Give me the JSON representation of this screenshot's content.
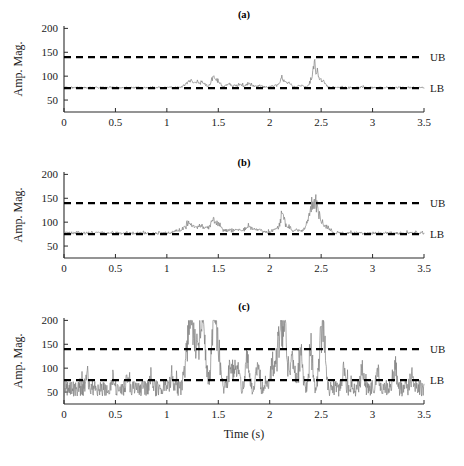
{
  "figure": {
    "width": 464,
    "height": 466,
    "background": "#ffffff",
    "signal_color": "#808080",
    "bound_color": "#000000",
    "axis_color": "#2b2b2b"
  },
  "axis_titles": {
    "x": "Time (s)",
    "y": "Amp. Mag."
  },
  "bounds": {
    "upper_label": "UB",
    "lower_label": "LB",
    "upper_value": 140,
    "lower_value": 75
  },
  "chart_data": [
    {
      "type": "line",
      "title": "(a)",
      "xlabel": "",
      "ylabel": "Amp. Mag.",
      "xlim": [
        0,
        3.5
      ],
      "ylim": [
        25,
        205
      ],
      "xticks": [
        0,
        0.5,
        1,
        1.5,
        2,
        2.5,
        3,
        3.5
      ],
      "xticklabels": [
        "0",
        "0.5",
        "1",
        "1.5",
        "2",
        "2.5",
        "3",
        "3.5"
      ],
      "yticks": [
        50,
        100,
        150,
        200
      ],
      "yticklabels": [
        "50",
        "100",
        "150",
        "200"
      ],
      "grid": false,
      "legend": "none",
      "annotations": [
        {
          "text": "UB",
          "y": 140,
          "position": "right-outside"
        },
        {
          "text": "LB",
          "y": 75,
          "position": "right-outside"
        }
      ],
      "hlines": [
        140,
        75
      ],
      "series": [
        {
          "name": "amplitude-magnitude",
          "color": "#808080",
          "baseline": 76,
          "noise": 2.0,
          "seed": 11,
          "n_points": 700,
          "bursts": [
            {
              "center": 1.22,
              "width": 0.035,
              "amp": 20
            },
            {
              "center": 1.29,
              "width": 0.03,
              "amp": 10
            },
            {
              "center": 1.35,
              "width": 0.03,
              "amp": 13
            },
            {
              "center": 1.45,
              "width": 0.022,
              "amp": 22
            },
            {
              "center": 1.49,
              "width": 0.025,
              "amp": 20
            },
            {
              "center": 1.6,
              "width": 0.03,
              "amp": 9
            },
            {
              "center": 1.7,
              "width": 0.035,
              "amp": 8
            },
            {
              "center": 1.8,
              "width": 0.03,
              "amp": 11
            },
            {
              "center": 1.9,
              "width": 0.03,
              "amp": 6
            },
            {
              "center": 2.05,
              "width": 0.03,
              "amp": 7
            },
            {
              "center": 2.12,
              "width": 0.022,
              "amp": 26
            },
            {
              "center": 2.18,
              "width": 0.03,
              "amp": 12
            },
            {
              "center": 2.3,
              "width": 0.03,
              "amp": 6
            },
            {
              "center": 2.44,
              "width": 0.03,
              "amp": 63
            },
            {
              "center": 2.52,
              "width": 0.025,
              "amp": 18
            }
          ]
        }
      ]
    },
    {
      "type": "line",
      "title": "(b)",
      "xlabel": "",
      "ylabel": "Amp. Mag.",
      "xlim": [
        0,
        3.5
      ],
      "ylim": [
        25,
        205
      ],
      "xticks": [
        0,
        0.5,
        1,
        1.5,
        2,
        2.5,
        3,
        3.5
      ],
      "xticklabels": [
        "0",
        "0.5",
        "1",
        "1.5",
        "2",
        "2.5",
        "3",
        "3.5"
      ],
      "yticks": [
        50,
        100,
        150,
        200
      ],
      "yticklabels": [
        "50",
        "100",
        "150",
        "200"
      ],
      "grid": false,
      "legend": "none",
      "annotations": [
        {
          "text": "UB",
          "y": 140,
          "position": "right-outside"
        },
        {
          "text": "LB",
          "y": 75,
          "position": "right-outside"
        }
      ],
      "hlines": [
        140,
        75
      ],
      "series": [
        {
          "name": "amplitude-magnitude",
          "color": "#808080",
          "baseline": 77,
          "noise": 3.0,
          "seed": 29,
          "n_points": 700,
          "bursts": [
            {
              "center": 1.1,
              "width": 0.03,
              "amp": 6
            },
            {
              "center": 1.2,
              "width": 0.035,
              "amp": 24
            },
            {
              "center": 1.26,
              "width": 0.03,
              "amp": 14
            },
            {
              "center": 1.33,
              "width": 0.03,
              "amp": 20
            },
            {
              "center": 1.4,
              "width": 0.025,
              "amp": 12
            },
            {
              "center": 1.45,
              "width": 0.022,
              "amp": 30
            },
            {
              "center": 1.5,
              "width": 0.025,
              "amp": 25
            },
            {
              "center": 1.6,
              "width": 0.035,
              "amp": 10
            },
            {
              "center": 1.7,
              "width": 0.035,
              "amp": 11
            },
            {
              "center": 1.8,
              "width": 0.035,
              "amp": 17
            },
            {
              "center": 1.9,
              "width": 0.035,
              "amp": 10
            },
            {
              "center": 2.05,
              "width": 0.03,
              "amp": 12
            },
            {
              "center": 2.12,
              "width": 0.022,
              "amp": 46
            },
            {
              "center": 2.18,
              "width": 0.03,
              "amp": 18
            },
            {
              "center": 2.28,
              "width": 0.03,
              "amp": 9
            },
            {
              "center": 2.37,
              "width": 0.03,
              "amp": 16
            },
            {
              "center": 2.43,
              "width": 0.035,
              "amp": 92
            },
            {
              "center": 2.5,
              "width": 0.025,
              "amp": 30
            },
            {
              "center": 2.56,
              "width": 0.025,
              "amp": 14
            }
          ]
        }
      ]
    },
    {
      "type": "line",
      "title": "(c)",
      "xlabel": "Time (s)",
      "ylabel": "Amp. Mag.",
      "xlim": [
        0,
        3.5
      ],
      "ylim": [
        25,
        205
      ],
      "xticks": [
        0,
        0.5,
        1,
        1.5,
        2,
        2.5,
        3,
        3.5
      ],
      "xticklabels": [
        "0",
        "0.5",
        "1",
        "1.5",
        "2",
        "2.5",
        "3",
        "3.5"
      ],
      "yticks": [
        50,
        100,
        150,
        200
      ],
      "yticklabels": [
        "50",
        "100",
        "150",
        "200"
      ],
      "grid": false,
      "legend": "none",
      "annotations": [
        {
          "text": "UB",
          "y": 140,
          "position": "right-outside"
        },
        {
          "text": "LB",
          "y": 75,
          "position": "right-outside"
        }
      ],
      "hlines": [
        140,
        75
      ],
      "clip_max": 200,
      "series": [
        {
          "name": "amplitude-magnitude",
          "color": "#808080",
          "baseline": 58,
          "noise": 17,
          "seed": 7,
          "n_points": 900,
          "bursts": [
            {
              "center": 0.22,
              "width": 0.012,
              "amp": 40
            },
            {
              "center": 0.47,
              "width": 0.012,
              "amp": 30
            },
            {
              "center": 0.62,
              "width": 0.012,
              "amp": 34
            },
            {
              "center": 0.85,
              "width": 0.012,
              "amp": 42
            },
            {
              "center": 1.05,
              "width": 0.015,
              "amp": 38
            },
            {
              "center": 1.21,
              "width": 0.028,
              "amp": 150
            },
            {
              "center": 1.25,
              "width": 0.02,
              "amp": 120
            },
            {
              "center": 1.32,
              "width": 0.03,
              "amp": 150
            },
            {
              "center": 1.36,
              "width": 0.022,
              "amp": 130
            },
            {
              "center": 1.45,
              "width": 0.018,
              "amp": 150
            },
            {
              "center": 1.49,
              "width": 0.024,
              "amp": 150
            },
            {
              "center": 1.62,
              "width": 0.02,
              "amp": 75
            },
            {
              "center": 1.68,
              "width": 0.022,
              "amp": 70
            },
            {
              "center": 1.78,
              "width": 0.016,
              "amp": 95
            },
            {
              "center": 1.88,
              "width": 0.018,
              "amp": 55
            },
            {
              "center": 2.02,
              "width": 0.016,
              "amp": 60
            },
            {
              "center": 2.1,
              "width": 0.03,
              "amp": 150
            },
            {
              "center": 2.15,
              "width": 0.022,
              "amp": 130
            },
            {
              "center": 2.22,
              "width": 0.02,
              "amp": 85
            },
            {
              "center": 2.3,
              "width": 0.018,
              "amp": 95
            },
            {
              "center": 2.4,
              "width": 0.014,
              "amp": 130
            },
            {
              "center": 2.5,
              "width": 0.018,
              "amp": 150
            },
            {
              "center": 2.53,
              "width": 0.014,
              "amp": 140
            },
            {
              "center": 2.72,
              "width": 0.014,
              "amp": 45
            },
            {
              "center": 2.9,
              "width": 0.014,
              "amp": 55
            },
            {
              "center": 3.05,
              "width": 0.014,
              "amp": 48
            },
            {
              "center": 3.22,
              "width": 0.014,
              "amp": 60
            },
            {
              "center": 3.38,
              "width": 0.014,
              "amp": 42
            }
          ]
        }
      ]
    }
  ]
}
